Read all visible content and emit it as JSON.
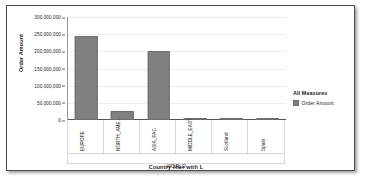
{
  "chart_data": {
    "type": "bar",
    "title": "",
    "categories": [
      "EUROPE",
      "NORTH_AME...",
      "ASIA_PAC",
      "MIDDLE_EAST",
      "Scotland",
      "Spain"
    ],
    "values": [
      244000000,
      25000000,
      201000000,
      5000000,
      500000,
      3000000
    ],
    "series": [
      {
        "name": "Order Amount",
        "values": [
          244000000,
          25000000,
          201000000,
          5000000,
          500000,
          3000000
        ]
      }
    ],
    "xlabel": "Country Hier with L",
    "ylabel": "Order Amount",
    "ylim": [
      0,
      300000000
    ],
    "ytick_labels": [
      "300,000,000",
      "250,000,000",
      "200,000,000",
      "150,000,000",
      "100,000,000",
      "50,000,000",
      "0"
    ],
    "ytick_values": [
      300000000,
      250000000,
      200000000,
      150000000,
      100000000,
      50000000,
      0
    ],
    "group_label": "WORLD",
    "grid": true,
    "legend_position": "right",
    "bar_color": "#808080",
    "grid_color": "#ededed",
    "axis_color": "#555555"
  },
  "legend": {
    "title": "All Measures",
    "entries": [
      {
        "label": "Order Amount",
        "color": "#808080"
      }
    ]
  },
  "panel": {
    "border_color": "#4a4a4a",
    "background": "#ffffff"
  }
}
